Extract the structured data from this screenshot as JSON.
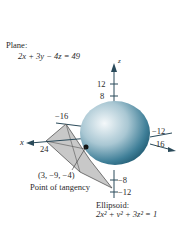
{
  "plane": {
    "title": "Plane:",
    "equation": "2x + 3y − 4z = 49"
  },
  "axes": {
    "z_label": "z",
    "x_label": "x",
    "z_ticks": [
      "12",
      "8",
      "−8",
      "−12"
    ],
    "y_ticks": [
      "−16",
      "−12",
      "16"
    ],
    "x_ticks": [
      "24"
    ]
  },
  "tangent_point": {
    "coords": "(3, −9, −4)",
    "caption": "Point of tangency"
  },
  "ellipsoid": {
    "title": "Ellipsoid:",
    "equation": "2x² + y² + 3z² = 1"
  },
  "colors": {
    "ellipsoid_light": "#e8f0f4",
    "ellipsoid_dark": "#1f5f78",
    "plane_fill": "#c8c8c8",
    "axis": "#2a4a5a"
  }
}
